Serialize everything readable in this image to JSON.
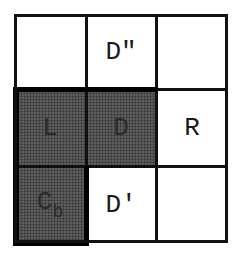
{
  "diagram": {
    "type": "3x3 grid",
    "rows": [
      [
        {
          "label": "",
          "subscript": "",
          "shaded": false
        },
        {
          "label": "D\"",
          "subscript": "",
          "shaded": false
        },
        {
          "label": "",
          "subscript": "",
          "shaded": false
        }
      ],
      [
        {
          "label": "L",
          "subscript": "",
          "shaded": true
        },
        {
          "label": "D",
          "subscript": "",
          "shaded": true
        },
        {
          "label": "R",
          "subscript": "",
          "shaded": false
        }
      ],
      [
        {
          "label": "C",
          "subscript": "b",
          "shaded": true
        },
        {
          "label": "D′",
          "subscript": "",
          "shaded": false
        },
        {
          "label": "",
          "subscript": "",
          "shaded": false
        }
      ]
    ],
    "colors": {
      "line": "#111111",
      "shade": "#8a8a8a",
      "background": "#ffffff"
    }
  }
}
